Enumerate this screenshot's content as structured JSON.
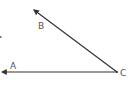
{
  "diagram": {
    "type": "angle",
    "vertex": {
      "label": "C",
      "x": 117,
      "y": 72
    },
    "rays": [
      {
        "name": "ray-CB",
        "label": "B",
        "end": {
          "x": 33,
          "y": 9
        },
        "label_pos": {
          "x": 40,
          "y": 27
        }
      },
      {
        "name": "ray-CA",
        "label": "A",
        "end": {
          "x": 1,
          "y": 72
        },
        "label_pos": {
          "x": 12,
          "y": 69
        }
      }
    ],
    "labels": {
      "A": "A",
      "B": "B",
      "C": "C"
    },
    "colors": {
      "line": "#333333",
      "text": "#555555",
      "background": "#ffffff"
    }
  }
}
